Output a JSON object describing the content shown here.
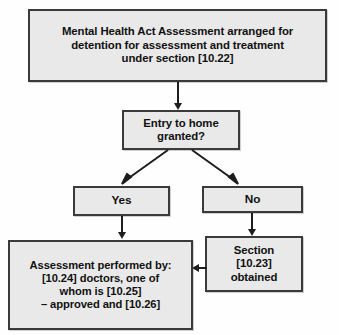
{
  "diagram": {
    "background_color": "#fefefe",
    "node_fill_color": "#e9e9e9",
    "node_border_color": "#3a3a3a",
    "connector_color": "#1d1d1d",
    "nodes": {
      "mha_assessment": {
        "label": "Mental Health Act Assessment arranged for detention for assessment and treatment under section [10.22]",
        "line1": "Mental Health Act Assessment arranged for",
        "line2": "detention for assessment and treatment",
        "line3": "under section [10.22]"
      },
      "entry_decision": {
        "label": "Entry to home granted?",
        "line1": "Entry to home",
        "line2": "granted?"
      },
      "yes_branch": {
        "label": "Yes"
      },
      "no_branch": {
        "label": "No"
      },
      "assessment_performed": {
        "label": "Assessment performed by: [10.24] doctors, one of whom is [10.25] – approved and [10.26]",
        "line1": "Assessment performed by:",
        "line2": "[10.24] doctors, one of",
        "line3": "whom is [10.25]",
        "line4": "– approved and [10.26]"
      },
      "section_obtained": {
        "label": "Section [10.23] obtained",
        "line1": "Section",
        "line2": "[10.23]",
        "line3": "obtained"
      }
    },
    "connectors": [
      {
        "name": "mha-to-entry",
        "from": "mha_assessment",
        "to": "entry_decision",
        "kind": "vertical-arrow"
      },
      {
        "name": "entry-to-yes",
        "from": "entry_decision",
        "to": "yes_branch",
        "kind": "diagonal-arrow"
      },
      {
        "name": "entry-to-no",
        "from": "entry_decision",
        "to": "no_branch",
        "kind": "diagonal-arrow"
      },
      {
        "name": "yes-to-assessment",
        "from": "yes_branch",
        "to": "assessment_performed",
        "kind": "vertical-arrow"
      },
      {
        "name": "no-to-section",
        "from": "no_branch",
        "to": "section_obtained",
        "kind": "vertical-arrow"
      },
      {
        "name": "section-to-assessment",
        "from": "section_obtained",
        "to": "assessment_performed",
        "kind": "horizontal-arrow-left"
      }
    ]
  }
}
